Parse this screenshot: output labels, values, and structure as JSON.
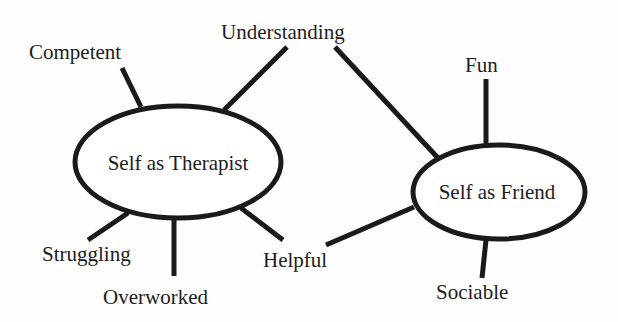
{
  "diagram": {
    "type": "concept-map",
    "colors": {
      "stroke": "#1a1a1a",
      "text": "#1c1c1c",
      "background": "#fefefe"
    },
    "nodes": [
      {
        "id": "therapist",
        "label": "Self as Therapist",
        "shape": "ellipse"
      },
      {
        "id": "friend",
        "label": "Self as Friend",
        "shape": "ellipse"
      }
    ],
    "attributes": [
      {
        "id": "competent",
        "label": "Competent"
      },
      {
        "id": "understanding",
        "label": "Understanding"
      },
      {
        "id": "fun",
        "label": "Fun"
      },
      {
        "id": "struggling",
        "label": "Struggling"
      },
      {
        "id": "overworked",
        "label": "Overworked"
      },
      {
        "id": "helpful",
        "label": "Helpful"
      },
      {
        "id": "sociable",
        "label": "Sociable"
      }
    ],
    "edges": [
      {
        "from": "therapist",
        "to": "competent"
      },
      {
        "from": "therapist",
        "to": "understanding"
      },
      {
        "from": "friend",
        "to": "understanding"
      },
      {
        "from": "friend",
        "to": "fun"
      },
      {
        "from": "therapist",
        "to": "struggling"
      },
      {
        "from": "therapist",
        "to": "overworked"
      },
      {
        "from": "therapist",
        "to": "helpful"
      },
      {
        "from": "friend",
        "to": "helpful"
      },
      {
        "from": "friend",
        "to": "sociable"
      }
    ]
  }
}
